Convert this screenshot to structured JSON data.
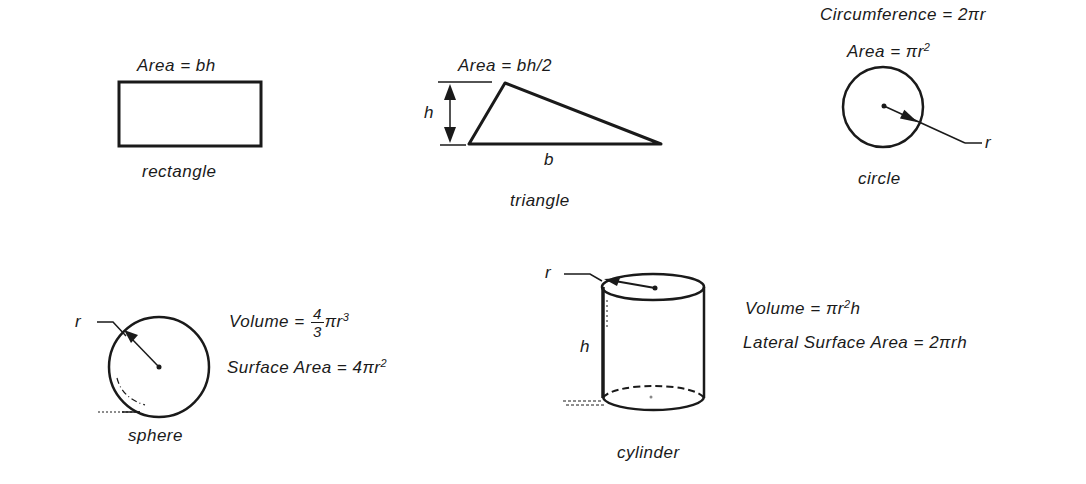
{
  "figures": {
    "rectangle": {
      "name": "rectangle",
      "formula": "Area = bh"
    },
    "triangle": {
      "name": "triangle",
      "formula": "Area = bh/2",
      "height_label": "h",
      "base_label": "b"
    },
    "circle": {
      "name": "circle",
      "circumference_formula": "Circumference = 2πr",
      "area_prefix": "Area = πr",
      "area_exp": "2",
      "radius_label": "r"
    },
    "sphere": {
      "name": "sphere",
      "radius_label": "r",
      "volume_prefix": "Volume = ",
      "volume_num": "4",
      "volume_den": "3",
      "volume_suffix": "πr",
      "volume_exp": "3",
      "surface_prefix": "Surface Area = 4πr",
      "surface_exp": "2"
    },
    "cylinder": {
      "name": "cylinder",
      "radius_label": "r",
      "height_label": "h",
      "volume_prefix": "Volume = πr",
      "volume_exp": "2",
      "volume_suffix": "h",
      "lateral_formula": "Lateral Surface Area = 2πrh"
    }
  },
  "colors": {
    "ink": "#1a1a1a",
    "background": "#ffffff"
  }
}
